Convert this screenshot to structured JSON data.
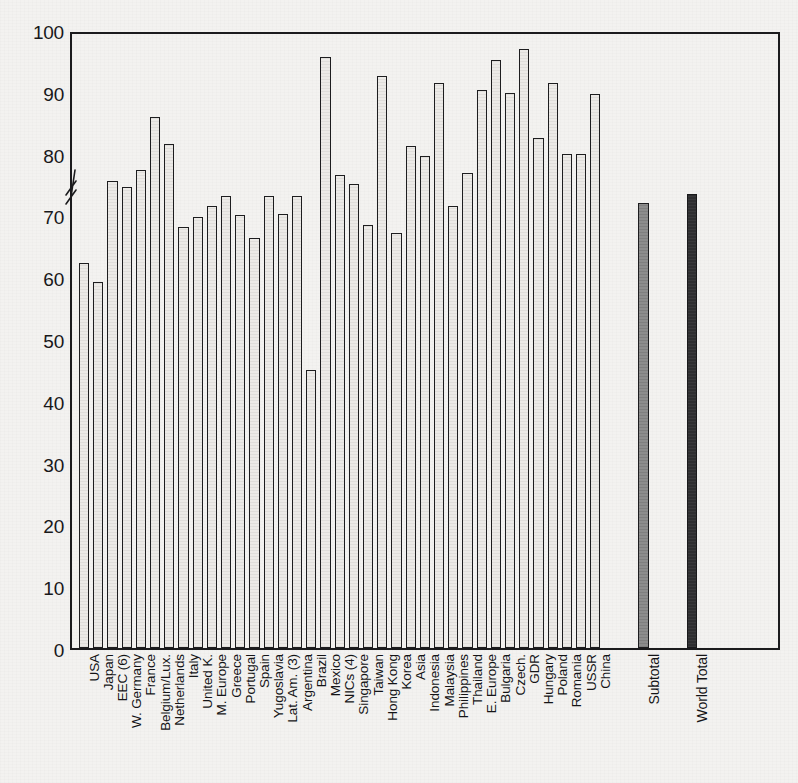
{
  "chart_data": {
    "type": "bar",
    "title": "",
    "subtitle": "",
    "xlabel": "",
    "ylabel": "",
    "ylim": [
      0,
      100
    ],
    "yticks": [
      0,
      10,
      20,
      30,
      40,
      50,
      60,
      70,
      80,
      90,
      100
    ],
    "grid": false,
    "legend": "none",
    "axis_break": true,
    "categories": [
      "USA",
      "Japan",
      "EEC (6)",
      "W. Germany",
      "France",
      "Belgium/Lux.",
      "Netherlands",
      "Italy",
      "United K.",
      "M. Europe",
      "Greece",
      "Portugal",
      "Spain",
      "Yugoslavia",
      "Lat. Am. (3)",
      "Argentina",
      "Brazil",
      "Mexico",
      "NICs (4)",
      "Singapore",
      "Taiwan",
      "Hong Kong",
      "Korea",
      "Asia",
      "Indonesia",
      "Malaysia",
      "Philippines",
      "Thailand",
      "E. Europe",
      "Bulgaria",
      "Czech.",
      "GDR",
      "Hungary",
      "Poland",
      "Romania",
      "USSR",
      "China",
      "Subtotal",
      "World Total"
    ],
    "values": [
      62.3,
      59.3,
      75.5,
      74.6,
      77.3,
      86.0,
      81.5,
      68.2,
      69.7,
      71.6,
      73.2,
      70.1,
      66.3,
      73.2,
      70.2,
      73.2,
      45.0,
      95.7,
      76.6,
      75.1,
      68.4,
      92.5,
      67.2,
      81.3,
      79.6,
      91.5,
      71.6,
      76.8,
      90.3,
      95.2,
      89.8,
      97.0,
      82.5,
      91.5,
      79.9,
      79.9,
      89.7,
      72.0,
      73.5
    ],
    "bar_styles": [
      "hollow",
      "hollow",
      "hollow",
      "hollow",
      "hollow",
      "hollow",
      "hollow",
      "hollow",
      "hollow",
      "hollow",
      "hollow",
      "hollow",
      "hollow",
      "hollow",
      "hollow",
      "hollow",
      "hollow",
      "hollow",
      "hollow",
      "hollow",
      "hollow",
      "hollow",
      "hollow",
      "hollow",
      "hollow",
      "hollow",
      "hollow",
      "hollow",
      "hollow",
      "hollow",
      "hollow",
      "hollow",
      "hollow",
      "hollow",
      "hollow",
      "hollow",
      "hollow",
      "gray",
      "dark"
    ],
    "group_gaps_after": [
      36,
      37
    ],
    "colors": {
      "bar_hollow": "#eceae7",
      "bar_gray": "#8d8d8d",
      "bar_dark": "#2e2e30",
      "outline": "#1d1d1f",
      "axis": "#1b1b1d",
      "background": "#f3f2f0",
      "text": "#141416"
    }
  }
}
